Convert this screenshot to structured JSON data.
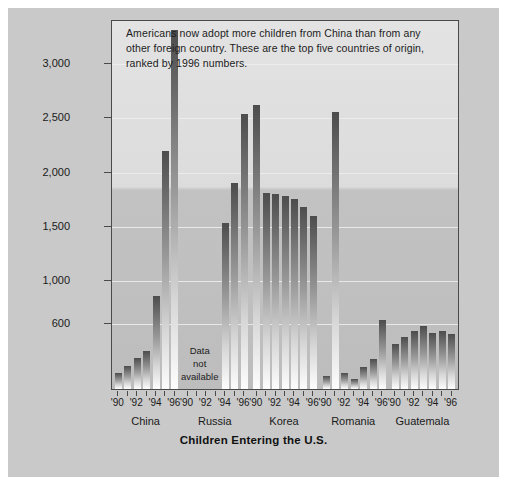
{
  "caption": "Americans now adopt more children from China than from any other foreign country. These are the top five countries of origin, ranked by 1996 numbers.",
  "na_label": {
    "line1": "Data",
    "line2": "not",
    "line3": "available"
  },
  "colors": {
    "page_background": "#c9c9c9",
    "outer_background": "#ffffff",
    "plot_background": "#dcdcdc",
    "frame": "#4a4a4a",
    "gridline": "#efefef",
    "bar_top": "#4d4d4d",
    "bar_bottom": "#fdfdfd",
    "text": "#1a1a1a"
  },
  "chart_data": {
    "type": "bar",
    "title": "Children Entering the U.S.",
    "xlabel": "",
    "ylabel": "",
    "ylim": [
      0,
      3400
    ],
    "yticks": [
      600,
      1000,
      1500,
      2000,
      2500,
      3000
    ],
    "ytick_labels": [
      "600",
      "1,000",
      "1,500",
      "2,000",
      "2,500",
      "3,000"
    ],
    "grid": true,
    "legend": "none",
    "x": [
      "'90",
      "'91",
      "'92",
      "'93",
      "'94",
      "'95",
      "'96"
    ],
    "xtick_labels_shown": [
      "'90",
      "'92",
      "'94",
      "'96"
    ],
    "groups": [
      {
        "name": "China",
        "values": [
          150,
          210,
          290,
          350,
          860,
          2200,
          3320
        ],
        "data_available": true
      },
      {
        "name": "Russia",
        "values": [
          null,
          null,
          null,
          null,
          1530,
          1900,
          2540
        ],
        "data_available": false,
        "missing_years": [
          "'90",
          "'91",
          "'92",
          "'93"
        ],
        "note": "Data not available"
      },
      {
        "name": "Korea",
        "values": [
          2620,
          1810,
          1800,
          1780,
          1760,
          1680,
          1600
        ],
        "data_available": true
      },
      {
        "name": "Romania",
        "values": [
          120,
          2560,
          150,
          90,
          200,
          280,
          640
        ],
        "data_available": true
      },
      {
        "name": "Guatemala",
        "values": [
          420,
          480,
          540,
          580,
          520,
          540,
          510
        ],
        "data_available": true
      }
    ]
  }
}
